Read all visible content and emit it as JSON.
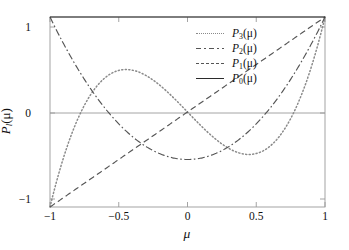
{
  "chart_data": {
    "type": "line",
    "title": "",
    "xlabel": "μ",
    "ylabel_html": "P_l(μ)",
    "xlim": [
      -1,
      1
    ],
    "ylim": [
      -1,
      1
    ],
    "xticks": [
      -1,
      -0.5,
      0,
      0.5,
      1
    ],
    "xtick_labels": [
      "−1",
      "−0.5",
      "0",
      "0.5",
      "1"
    ],
    "yticks": [
      -1,
      0,
      1
    ],
    "ytick_labels": [
      "−1",
      "0",
      "1"
    ],
    "grid": false,
    "zero_line": true,
    "legend_position": "upper-center-right",
    "series": [
      {
        "name": "P_3",
        "legend_label": "P3(μ)",
        "linestyle": "dotted",
        "color": "#8a8a8a",
        "formula": "(5x^3 - 3x)/2",
        "x": [
          -1,
          -0.9,
          -0.8,
          -0.7,
          -0.6,
          -0.5,
          -0.45,
          -0.4,
          -0.3,
          -0.2,
          -0.1,
          0,
          0.1,
          0.2,
          0.3,
          0.4,
          0.45,
          0.5,
          0.6,
          0.7,
          0.8,
          0.9,
          1
        ],
        "y": [
          -1,
          -0.4725,
          -0.08,
          0.1925,
          0.36,
          0.4375,
          0.4444,
          0.44,
          0.3825,
          0.28,
          0.1475,
          0,
          -0.1475,
          -0.28,
          -0.3825,
          -0.44,
          -0.4444,
          -0.4375,
          -0.36,
          -0.1925,
          0.08,
          0.4725,
          1
        ]
      },
      {
        "name": "P_2",
        "legend_label": "P2(μ)",
        "linestyle": "dashdot",
        "color": "#555555",
        "formula": "(3x^2 - 1)/2",
        "x": [
          -1,
          -0.8,
          -0.6,
          -0.4,
          -0.2,
          0,
          0.2,
          0.4,
          0.6,
          0.8,
          1
        ],
        "y": [
          1,
          0.46,
          0.04,
          -0.26,
          -0.44,
          -0.5,
          -0.44,
          -0.26,
          0.04,
          0.46,
          1
        ]
      },
      {
        "name": "P_1",
        "legend_label": "P1(μ)",
        "linestyle": "dashed",
        "color": "#555555",
        "formula": "x",
        "x": [
          -1,
          0,
          1
        ],
        "y": [
          -1,
          0,
          1
        ]
      },
      {
        "name": "P_0",
        "legend_label": "P0(μ)",
        "linestyle": "solid",
        "color": "#2b2b2b",
        "formula": "1",
        "x": [
          -1,
          1
        ],
        "y": [
          1,
          1
        ]
      }
    ]
  },
  "axes": {
    "frame_color": "#9a9a9a",
    "zero_line_color": "#9a9a9a",
    "background": "#ffffff",
    "xlabel": "μ",
    "ylabel_main": "P",
    "ylabel_sub": "l",
    "ylabel_tail": "(μ)"
  },
  "legend": {
    "entries": [
      {
        "main": "P",
        "sub": "3",
        "tail": "(μ)",
        "style": "dotted"
      },
      {
        "main": "P",
        "sub": "2",
        "tail": "(μ)",
        "style": "dashdot"
      },
      {
        "main": "P",
        "sub": "1",
        "tail": "(μ)",
        "style": "dashed"
      },
      {
        "main": "P",
        "sub": "0",
        "tail": "(μ)",
        "style": "solid"
      }
    ]
  },
  "ticks": {
    "x": [
      "−1",
      "−0.5",
      "0",
      "0.5",
      "1"
    ],
    "y": [
      "1",
      "0",
      "−1"
    ]
  }
}
